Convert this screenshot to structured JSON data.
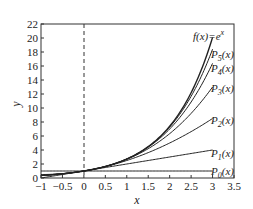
{
  "chart_data": {
    "type": "line",
    "title": "",
    "xlabel": "x",
    "ylabel": "y",
    "xlim": [
      -1,
      3.5
    ],
    "ylim": [
      0,
      22
    ],
    "x_ticks": [
      "-1",
      "-0.5",
      "0",
      "0.5",
      "1",
      "1.5",
      "2",
      "2.5",
      "3",
      "3.5"
    ],
    "y_ticks": [
      "0",
      "2",
      "4",
      "6",
      "8",
      "10",
      "12",
      "14",
      "16",
      "18",
      "20",
      "22"
    ],
    "grid": false,
    "vertical_reference_line": {
      "x": 0,
      "style": "dashed"
    },
    "x_range_plotted": [
      -1,
      3
    ],
    "series": [
      {
        "name": "f(x)=e^x",
        "label": "f(x)=e",
        "label_sup": "x",
        "formula": "exp(x)",
        "values_at": {
          "x": [
            -1,
            0,
            1,
            2,
            3
          ],
          "y": [
            0.368,
            1,
            2.718,
            7.389,
            20.086
          ]
        }
      },
      {
        "name": "P5(x)",
        "label": "P",
        "label_sub": "5",
        "label_tail": "(x)",
        "degree": 5,
        "values_at": {
          "x": [
            -1,
            0,
            1,
            2,
            3
          ],
          "y": [
            0.367,
            1,
            2.717,
            7.267,
            18.4
          ]
        }
      },
      {
        "name": "P4(x)",
        "label": "P",
        "label_sub": "4",
        "label_tail": "(x)",
        "degree": 4,
        "values_at": {
          "x": [
            -1,
            0,
            1,
            2,
            3
          ],
          "y": [
            0.375,
            1,
            2.708,
            7.0,
            16.375
          ]
        }
      },
      {
        "name": "P3(x)",
        "label": "P",
        "label_sub": "3",
        "label_tail": "(x)",
        "degree": 3,
        "values_at": {
          "x": [
            -1,
            0,
            1,
            2,
            3
          ],
          "y": [
            0.333,
            1,
            2.667,
            6.333,
            13.0
          ]
        }
      },
      {
        "name": "P2(x)",
        "label": "P",
        "label_sub": "2",
        "label_tail": "(x)",
        "degree": 2,
        "values_at": {
          "x": [
            -1,
            0,
            1,
            2,
            3
          ],
          "y": [
            0.5,
            1,
            2.5,
            5.0,
            8.5
          ]
        }
      },
      {
        "name": "P1(x)",
        "label": "P",
        "label_sub": "1",
        "label_tail": "(x)",
        "degree": 1,
        "values_at": {
          "x": [
            -1,
            0,
            1,
            2,
            3
          ],
          "y": [
            0,
            1,
            2,
            3,
            4
          ]
        }
      },
      {
        "name": "P0(x)",
        "label": "P",
        "label_sub": "0",
        "label_tail": "(x)",
        "degree": 0,
        "values_at": {
          "x": [
            -1,
            0,
            1,
            2,
            3
          ],
          "y": [
            1,
            1,
            1,
            1,
            1
          ]
        }
      }
    ],
    "legend": "inline labels at right end of curves"
  },
  "colors": {
    "line": "#222222",
    "axis": "#333333",
    "background": "#ffffff"
  }
}
